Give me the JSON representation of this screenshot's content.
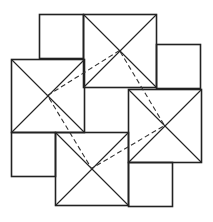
{
  "diagram": {
    "title": "",
    "colors": {
      "background": "#ffffff",
      "stroke": "#222222",
      "dashed": "#333333"
    },
    "large_squares": [
      {
        "id": "top",
        "x": 83,
        "y": 14,
        "size": 73
      },
      {
        "id": "left",
        "x": 11,
        "y": 59,
        "size": 73
      },
      {
        "id": "right",
        "x": 128,
        "y": 89,
        "size": 73
      },
      {
        "id": "bottom",
        "x": 55,
        "y": 132,
        "size": 73
      }
    ],
    "small_squares": [
      {
        "id": "top-left",
        "x": 39,
        "y": 14,
        "size": 44
      },
      {
        "id": "right-upper",
        "x": 156,
        "y": 44,
        "size": 44
      },
      {
        "id": "left-lower",
        "x": 11,
        "y": 132,
        "size": 44
      },
      {
        "id": "bottom-right",
        "x": 128,
        "y": 162,
        "size": 44
      }
    ],
    "dashed_quadrilateral": [
      [
        119.5,
        50.5
      ],
      [
        47.5,
        95.5
      ],
      [
        91.5,
        168.5
      ],
      [
        164.5,
        125.5
      ]
    ]
  }
}
